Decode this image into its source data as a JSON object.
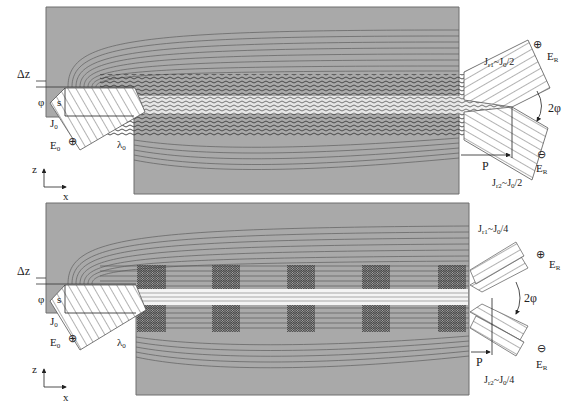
{
  "figure": {
    "panels": [
      {
        "id": "top",
        "description": "Single beam reflection with full Goos-Hanchen beam splitting",
        "labels": {
          "delta_z": "Δz",
          "phi": "φ",
          "s": "s",
          "j_incident": "J",
          "j_incident_sub": "0",
          "e_incident": "E",
          "e_incident_sub": "0",
          "lambda": "λ",
          "lambda_sub": "0",
          "j_out_1": "J",
          "j_out_1_sub": "r1",
          "j_out_1_rest": "~J",
          "j_out_1_rest_sub": "0",
          "j_out_1_tail": "/2",
          "j_out_2": "J",
          "j_out_2_sub": "r2",
          "j_out_2_rest": "~J",
          "j_out_2_rest_sub": "0",
          "j_out_2_tail": "/2",
          "two_phi": "2φ",
          "p": "P",
          "e_out_plus": "E",
          "e_out_plus_sub": "R",
          "e_out_minus": "E",
          "e_out_minus_sub": "R",
          "plus_symbol": "⊕",
          "minus_symbol": "⊖",
          "axis_z": "z",
          "axis_x": "x"
        }
      },
      {
        "id": "bottom",
        "description": "Beam reflection with periodic grating segments, splitting into four",
        "labels": {
          "delta_z": "Δz",
          "phi": "φ",
          "s": "s",
          "j_incident": "J",
          "j_incident_sub": "0",
          "e_incident": "E",
          "e_incident_sub": "0",
          "lambda": "λ",
          "lambda_sub": "0",
          "j_out_1": "J",
          "j_out_1_sub": "r1",
          "j_out_1_rest": "~J",
          "j_out_1_rest_sub": "0",
          "j_out_1_tail": "/4",
          "j_out_2": "J",
          "j_out_2_sub": "r2",
          "j_out_2_rest": "~J",
          "j_out_2_rest_sub": "0",
          "j_out_2_tail": "/4",
          "two_phi": "2φ",
          "p": "P",
          "e_out_plus": "E",
          "e_out_plus_sub": "R",
          "e_out_minus": "E",
          "e_out_minus_sub": "R",
          "plus_symbol": "⊕",
          "minus_symbol": "⊖",
          "axis_z": "z",
          "axis_x": "x"
        },
        "grating_blocks": 5
      }
    ],
    "colors": {
      "medium": "#a9a9a9",
      "medium_border": "#6e6e6e",
      "contour": "#5a5a5a",
      "beam_core": "#f4f4f4",
      "hatch": "#555555",
      "text": "#222222"
    }
  }
}
